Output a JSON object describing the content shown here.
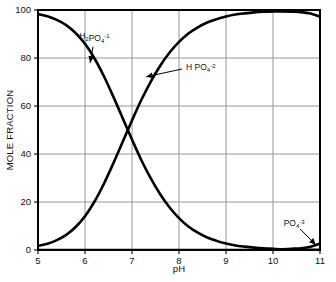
{
  "chart_data": {
    "type": "line",
    "title": "",
    "xlabel": "pH",
    "ylabel": "MOLE FRACTION",
    "xlim": [
      5,
      11
    ],
    "ylim": [
      0,
      100
    ],
    "xticks": [
      "5",
      "6",
      "7",
      "8",
      "9",
      "10",
      "11"
    ],
    "yticks": [
      "0",
      "20",
      "40",
      "60",
      "80",
      "100"
    ],
    "grid": true,
    "legend_position": "inline-annotations",
    "x": [
      5.0,
      5.2,
      5.4,
      5.6,
      5.8,
      6.0,
      6.2,
      6.4,
      6.6,
      6.8,
      7.0,
      7.2,
      7.4,
      7.6,
      7.8,
      8.0,
      8.2,
      8.4,
      8.6,
      8.8,
      9.0,
      9.2,
      9.4,
      9.6,
      9.8,
      10.0,
      10.2,
      10.4,
      10.6,
      10.8,
      11.0
    ],
    "series": [
      {
        "name": "H2PO4-1",
        "label_plain": "H2PO4-1",
        "label_formula": {
          "parts": [
            {
              "t": "H",
              "k": "n"
            },
            {
              "t": "2",
              "k": "sub"
            },
            {
              "t": "PO",
              "k": "n"
            },
            {
              "t": "4",
              "k": "sub"
            },
            {
              "t": "-1",
              "k": "sup"
            }
          ]
        },
        "color": "#000000",
        "values": [
          98.3,
          97.4,
          95.9,
          93.7,
          90.4,
          85.9,
          79.9,
          72.5,
          64.0,
          55.0,
          46.0,
          37.4,
          29.8,
          23.2,
          17.7,
          13.3,
          9.8,
          7.2,
          5.2,
          3.8,
          2.7,
          1.9,
          1.4,
          1.0,
          0.7,
          0.5,
          0.3,
          0.2,
          0.15,
          0.1,
          0.07
        ],
        "annotation": {
          "text_x": 6.2,
          "text_y": 88,
          "point_x": 6.1,
          "point_y": 77
        }
      },
      {
        "name": "HPO4-2",
        "label_plain": "H PO4-2",
        "label_formula": {
          "parts": [
            {
              "t": "H PO",
              "k": "n"
            },
            {
              "t": "4",
              "k": "sub"
            },
            {
              "t": "-2",
              "k": "sup"
            }
          ]
        },
        "color": "#000000",
        "values": [
          1.7,
          2.6,
          4.1,
          6.3,
          9.6,
          14.1,
          20.1,
          27.5,
          36.0,
          45.0,
          54.0,
          62.6,
          70.2,
          76.8,
          82.3,
          86.7,
          90.2,
          92.8,
          94.8,
          96.2,
          97.3,
          98.1,
          98.6,
          99.0,
          99.25,
          99.4,
          99.4,
          99.3,
          99.1,
          98.5,
          97.2
        ],
        "annotation": {
          "text_x": 8.15,
          "text_y": 75,
          "point_x": 7.25,
          "point_y": 72
        }
      },
      {
        "name": "PO4-3",
        "label_plain": "PO4-3",
        "label_formula": {
          "parts": [
            {
              "t": "PO",
              "k": "n"
            },
            {
              "t": "4",
              "k": "sub"
            },
            {
              "t": "-3",
              "k": "sup"
            }
          ]
        },
        "color": "#000000",
        "values": [
          0.0,
          0.0,
          0.0,
          0.0,
          0.0,
          0.0,
          0.0,
          0.0,
          0.0,
          0.0,
          0.0,
          0.0,
          0.0,
          0.0,
          0.0,
          0.0,
          0.0,
          0.0,
          0.0,
          0.0,
          0.0,
          0.0,
          0.0,
          0.0,
          0.05,
          0.1,
          0.3,
          0.5,
          0.75,
          1.4,
          2.7
        ],
        "annotation": {
          "text_x": 10.45,
          "text_y": 10,
          "point_x": 10.95,
          "point_y": 1.5
        }
      }
    ]
  },
  "axes": {
    "x_title": "pH",
    "y_title": "MOLE FRACTION"
  }
}
